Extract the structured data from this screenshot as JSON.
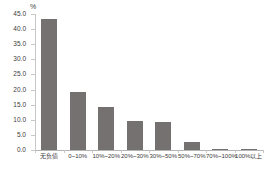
{
  "chart_data": {
    "type": "bar",
    "title": "",
    "subtitle": "",
    "xlabel": "",
    "ylabel": "",
    "unit_label": "%",
    "categories": [
      "无负债",
      "0~10%",
      "10%~20%",
      "20%~30%",
      "30%~50%",
      "50%~70%",
      "70%~100%",
      "100%以上"
    ],
    "values": [
      43.3,
      19.3,
      14.3,
      9.5,
      9.3,
      2.5,
      0.5,
      0.4
    ],
    "series": [
      {
        "name": "占比",
        "values": [
          43.3,
          19.3,
          14.3,
          9.5,
          9.3,
          2.5,
          0.5,
          0.4
        ]
      }
    ],
    "ylim": [
      0.0,
      45.0
    ],
    "ytick_step": 5.0,
    "ytick_labels": [
      "45.0",
      "40.0",
      "35.0",
      "30.0",
      "25.0",
      "20.0",
      "15.0",
      "10.0",
      "5.0",
      "0.0"
    ],
    "ytick_values": [
      45.0,
      40.0,
      35.0,
      30.0,
      25.0,
      20.0,
      15.0,
      10.0,
      5.0,
      0.0
    ],
    "grid": false,
    "legend": false,
    "legend_position": "none",
    "bar_color": "#767171",
    "axis_color": "#c8c8c8",
    "text_color": "#3c3c3c",
    "background": "#ffffff"
  }
}
